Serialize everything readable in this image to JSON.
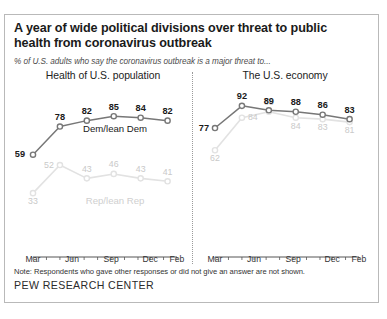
{
  "figure": {
    "title": "A year of wide political divisions over threat to public health from coronavirus outbreak",
    "subtitle": "% of U.S. adults who say the coronavirus outbreak is a major threat to...",
    "note": "Note: Respondents who gave other responses or did not give an answer are not shown.",
    "source": "PEW RESEARCH CENTER"
  },
  "colors": {
    "dem_line": "#777777",
    "rep_line": "#e2e2e2",
    "dem_label": "#1a1a1a",
    "rep_label": "#c9c9c9",
    "axis": "#555555",
    "border": "#b9b9b9"
  },
  "chart_data": [
    {
      "type": "line",
      "title": "Health of U.S. population",
      "panel": "left",
      "xlabel": "",
      "ylabel": "",
      "ylim": [
        0,
        100
      ],
      "grid": false,
      "x": [
        0,
        1,
        2,
        3,
        4,
        5
      ],
      "tick_positions": [
        0,
        1.45,
        2.9,
        4.35,
        5.35
      ],
      "tick_labels": [
        "Mar",
        "Jun",
        "Sep",
        "Dec",
        "Feb"
      ],
      "series": [
        {
          "name": "Dem/lean Dem",
          "color": "#777777",
          "label_color": "#1a1a1a",
          "values": [
            59,
            78,
            82,
            85,
            84,
            82
          ],
          "label_positions": [
            "below-left",
            "above",
            "above",
            "above",
            "above",
            "above"
          ],
          "annotation": "Dem/lean Dem",
          "annotation_x": 3.05,
          "annotation_y": 74
        },
        {
          "name": "Rep/lean Rep",
          "color": "#e2e2e2",
          "label_color": "#c9c9c9",
          "values": [
            33,
            52,
            43,
            46,
            43,
            41
          ],
          "label_positions": [
            "below",
            "left",
            "above",
            "above",
            "above",
            "above"
          ],
          "annotation": "Rep/lean Rep",
          "annotation_x": 3.05,
          "annotation_y": 26
        }
      ]
    },
    {
      "type": "line",
      "title": "The U.S. economy",
      "panel": "right",
      "xlabel": "",
      "ylabel": "",
      "ylim": [
        0,
        100
      ],
      "grid": false,
      "x": [
        0,
        1,
        2,
        3,
        4,
        5
      ],
      "tick_positions": [
        0,
        1.45,
        2.9,
        4.35,
        5.35
      ],
      "tick_labels": [
        "Mar",
        "Jun",
        "Sep",
        "Dec",
        "Feb"
      ],
      "series": [
        {
          "name": "Dem/lean Dem",
          "color": "#777777",
          "label_color": "#1a1a1a",
          "values": [
            77,
            92,
            89,
            88,
            86,
            83
          ],
          "label_positions": [
            "left",
            "above",
            "above",
            "above",
            "above",
            "above"
          ],
          "annotation": "",
          "annotation_x": 0,
          "annotation_y": 0
        },
        {
          "name": "Rep/lean Rep",
          "color": "#e2e2e2",
          "label_color": "#c9c9c9",
          "values": [
            62,
            84,
            88,
            84,
            83,
            81
          ],
          "label_positions": [
            "below",
            "right",
            "above",
            "below",
            "below",
            "below"
          ],
          "annotation": "",
          "annotation_x": 0,
          "annotation_y": 0
        }
      ]
    }
  ]
}
